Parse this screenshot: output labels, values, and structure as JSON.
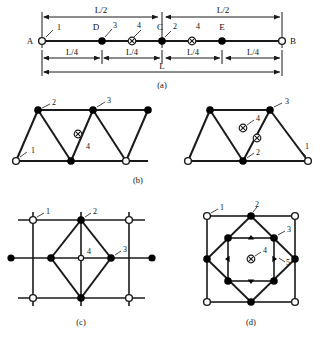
{
  "figure": {
    "panels": [
      {
        "id": "a",
        "caption": "(a)",
        "type": "beam-line",
        "endpoints": {
          "left": "A",
          "right": "B"
        },
        "interior_points": [
          "D",
          "C",
          "E"
        ],
        "node_labels": [
          "1",
          "3",
          "4",
          "2",
          "4"
        ],
        "dimensions_top": [
          "L/2",
          "L/2"
        ],
        "dimensions_mid": [
          "L/4",
          "L/4",
          "L/4",
          "L/4"
        ],
        "dimensions_bottom": [
          "L"
        ],
        "markers": [
          {
            "label": "A",
            "type": "open-circle",
            "x": 0.0
          },
          {
            "label": "D",
            "type": "filled-circle",
            "x": 0.25
          },
          {
            "label": "",
            "type": "crossed-circle",
            "x": 0.375
          },
          {
            "label": "C",
            "type": "filled-circle",
            "x": 0.5
          },
          {
            "label": "",
            "type": "crossed-circle",
            "x": 0.625
          },
          {
            "label": "E",
            "type": "filled-circle",
            "x": 0.75
          },
          {
            "label": "B",
            "type": "open-circle",
            "x": 1.0
          }
        ]
      },
      {
        "id": "b",
        "caption": "(b)",
        "type": "triangular-truss",
        "node_labels": [
          "1",
          "2",
          "3",
          "4"
        ],
        "marker_legend": [
          "open-circle",
          "filled-circle",
          "crossed-circle"
        ]
      },
      {
        "id": "b2",
        "caption": "",
        "type": "triangular-truss",
        "node_labels": [
          "1",
          "2",
          "3",
          "4"
        ],
        "marker_legend": [
          "open-circle",
          "filled-circle",
          "crossed-circle"
        ]
      },
      {
        "id": "c",
        "caption": "(c)",
        "type": "quad-grid-diamond",
        "node_labels": [
          "1",
          "2",
          "3",
          "4"
        ],
        "marker_legend": [
          "open-circle",
          "filled-circle",
          "small-open-circle"
        ]
      },
      {
        "id": "d",
        "caption": "(d)",
        "type": "quad-grid-nested",
        "node_labels": [
          "1",
          "2",
          "3",
          "4",
          "5"
        ],
        "marker_legend": [
          "open-circle",
          "filled-circle",
          "crossed-circle",
          "triangle"
        ]
      }
    ],
    "colors": {
      "line": "#1a1a1a",
      "fill": "#000000",
      "background": "#ffffff"
    }
  }
}
